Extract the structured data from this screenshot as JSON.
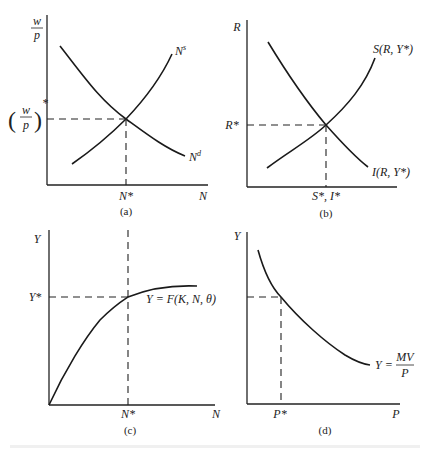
{
  "panels": {
    "a": {
      "caption": "(a)",
      "y_axis_label_num": "w",
      "y_axis_label_den": "p",
      "y_eq_label_star": "*",
      "x_axis_label": "N",
      "x_eq_label": "N*",
      "supply_curve_label": "N",
      "supply_curve_sup": "s",
      "demand_curve_label": "N",
      "demand_curve_sup": "d"
    },
    "b": {
      "caption": "(b)",
      "y_axis_label": "R",
      "y_eq_label": "R*",
      "x_eq_label": "S*, I*",
      "saving_curve_label": "S(R, Y*)",
      "investment_curve_label": "I(R, Y*)"
    },
    "c": {
      "caption": "(c)",
      "y_axis_label": "Y",
      "y_eq_label": "Y*",
      "x_axis_label": "N",
      "x_eq_label": "N*",
      "production_curve_label": "Y = F(K, N, θ)"
    },
    "d": {
      "caption": "(d)",
      "y_axis_label": "Y",
      "x_axis_label": "P",
      "x_eq_label": "P*",
      "curve_label_lhs": "Y =",
      "curve_label_num": "MV",
      "curve_label_den": "P"
    }
  },
  "figure_caption": "",
  "colors": {
    "ink": "#222222",
    "background": "#ffffff"
  }
}
